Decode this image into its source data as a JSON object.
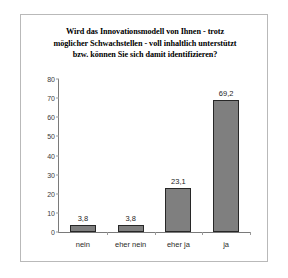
{
  "chart_data": {
    "type": "bar",
    "title": "Wird das Innovationsmodell von Ihnen - trotz möglicher Schwachstellen - voll inhaltlich unterstützt bzw. können Sie sich damit identifizieren?",
    "title_lines": [
      "Wird das Innovationsmodell von Ihnen - trotz",
      "möglicher Schwachstellen - voll inhaltlich unterstützt",
      "bzw. können Sie sich damit identifizieren?"
    ],
    "categories": [
      "nein",
      "eher nein",
      "eher ja",
      "ja"
    ],
    "values": [
      3.8,
      3.8,
      23.1,
      69.2
    ],
    "value_labels": [
      "3,8",
      "3,8",
      "23,1",
      "69,2"
    ],
    "xlabel": "",
    "ylabel": "",
    "ylim": [
      0,
      80
    ],
    "y_ticks": [
      0,
      10,
      20,
      30,
      40,
      50,
      60,
      70,
      80
    ],
    "y_tick_labels": [
      "0",
      "10",
      "20",
      "30",
      "40",
      "50",
      "60",
      "70",
      "80"
    ],
    "grid": false,
    "legend": false,
    "bar_color": "#7f7f7f",
    "bar_border_color": "#272727",
    "axis_color": "#7a7a7a",
    "background_color": "#ffffff"
  }
}
